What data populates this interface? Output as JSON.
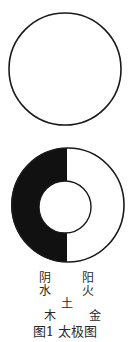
{
  "figure": {
    "caption": "图1  太极图",
    "colors": {
      "stroke": "#1a1a1a",
      "fill_dark": "#111111",
      "background": "#ffffff"
    },
    "diagrams": [
      {
        "name": "wuji-circle",
        "description": "empty circle"
      },
      {
        "name": "taiji-ring",
        "description": "ring split into dark left half and white right half with white inner circle"
      }
    ],
    "labels": {
      "yin": "阴",
      "yang": "阳",
      "water": "水",
      "fire": "火",
      "earth": "土",
      "wood": "木",
      "metal": "金"
    }
  }
}
